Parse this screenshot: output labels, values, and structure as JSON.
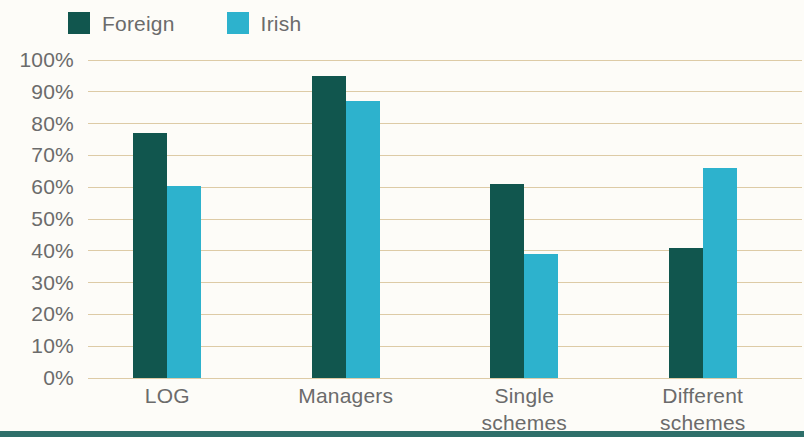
{
  "legend": {
    "items": [
      {
        "label": "Foreign",
        "color": "#11564e",
        "swatch_name": "legend-swatch-foreign"
      },
      {
        "label": "Irish",
        "color": "#2db2cd",
        "swatch_name": "legend-swatch-irish"
      }
    ]
  },
  "chart_data": {
    "type": "bar",
    "title": "",
    "subtitle": "",
    "xlabel": "",
    "ylabel": "",
    "ylim": [
      0,
      100
    ],
    "yticks": [
      "0%",
      "10%",
      "20%",
      "30%",
      "40%",
      "50%",
      "60%",
      "70%",
      "80%",
      "90%",
      "100%"
    ],
    "ytick_values": [
      0,
      10,
      20,
      30,
      40,
      50,
      60,
      70,
      80,
      90,
      100
    ],
    "grid": true,
    "grid_color": "#ddcba6",
    "legend_position": "top-left",
    "categories": [
      "LOG",
      "Managers",
      "Single\nschemes",
      "Different\nschemes"
    ],
    "series": [
      {
        "name": "Foreign",
        "color": "#11564e",
        "values": [
          77,
          95,
          61,
          41
        ]
      },
      {
        "name": "Irish",
        "color": "#2db2cd",
        "values": [
          60.5,
          87,
          39,
          66
        ]
      }
    ]
  },
  "colors": {
    "background": "#fdfcf8",
    "axis_text": "#6b6b6b",
    "gridline": "#ddcba6",
    "foreign": "#11564e",
    "irish": "#2db2cd",
    "bottom_strip": "#2e6f6a"
  }
}
